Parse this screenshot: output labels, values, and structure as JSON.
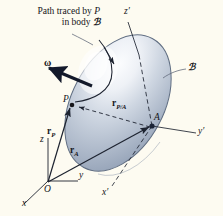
{
  "figure": {
    "title_caption": {
      "line1_prefix": "Path traced by ",
      "line1_italic": "P",
      "line2_prefix": "in body ",
      "line2_script": "ℬ"
    },
    "body_label": "ℬ",
    "labels": {
      "z_prime": "z′",
      "y_prime": "y′",
      "x_prime": "x′",
      "z": "z",
      "y": "y",
      "x": "x",
      "origin": "O",
      "point_p": "P",
      "point_a": "A",
      "omega": "ω",
      "r_p": "r",
      "r_p_sub": "P",
      "r_a": "r",
      "r_a_sub": "A",
      "r_pa": "r",
      "r_pa_sub": "P/A"
    },
    "colors": {
      "background": "#fdfbf1",
      "body_fill_light": "#f2f4f7",
      "body_fill_mid": "#b9c3d2",
      "body_fill_dark": "#8d9bb0",
      "body_stroke": "#5d6b80",
      "line": "#1d2330",
      "leader": "#5c6475",
      "text": "#15151a"
    },
    "geometry": {
      "ellipse_center": [
        118,
        103
      ],
      "ellipse_rx": 46,
      "ellipse_ry": 73,
      "ellipse_rotation_deg": 28,
      "origin_point": [
        48,
        182
      ],
      "point_p": [
        72,
        104
      ],
      "point_a": [
        152,
        126
      ]
    }
  }
}
